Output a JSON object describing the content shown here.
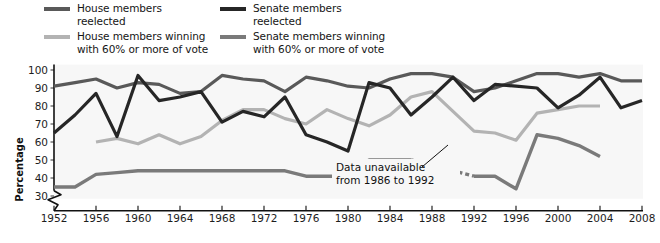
{
  "legend": {
    "columns": [
      [
        {
          "label": "House members reelected",
          "color": "#595959",
          "name": "legend-house-reelected"
        },
        {
          "label": "House members winning\nwith 60% or more of vote",
          "color": "#b3b3b3",
          "name": "legend-house-60"
        }
      ],
      [
        {
          "label": "Senate members reelected",
          "color": "#262626",
          "name": "legend-senate-reelected"
        },
        {
          "label": "Senate members winning\nwith 60% or more of vote",
          "color": "#7a7a7a",
          "name": "legend-senate-60"
        }
      ]
    ]
  },
  "annotation": {
    "line1": "Data unavailable",
    "line2": "from 1986 to 1992"
  },
  "chart_data": {
    "type": "line",
    "title": "",
    "xlabel": "",
    "ylabel": "Percentage",
    "xlim": [
      1950,
      2010
    ],
    "ylim": [
      28,
      103
    ],
    "yticks": [
      30,
      40,
      50,
      60,
      70,
      80,
      90,
      100
    ],
    "xticks": [
      1952,
      1956,
      1960,
      1964,
      1968,
      1972,
      1976,
      1980,
      1984,
      1988,
      1992,
      1996,
      2000,
      2004,
      2008
    ],
    "grid": true,
    "axis_break": true,
    "legend_position": "above-plot",
    "series": [
      {
        "name": "House members reelected",
        "color": "#595959",
        "width": 3.2,
        "x": [
          1952,
          1954,
          1956,
          1958,
          1960,
          1962,
          1964,
          1966,
          1968,
          1970,
          1972,
          1974,
          1976,
          1978,
          1980,
          1982,
          1984,
          1986,
          1988,
          1990,
          1992,
          1994,
          1996,
          1998,
          2000,
          2002,
          2004,
          2006,
          2008
        ],
        "values": [
          91,
          93,
          95,
          90,
          93,
          92,
          87,
          88,
          97,
          95,
          94,
          88,
          96,
          94,
          91,
          90,
          95,
          98,
          98,
          96,
          88,
          90,
          94,
          98,
          98,
          96,
          98,
          94,
          94
        ]
      },
      {
        "name": "House members winning with 60% or more of vote",
        "color": "#b3b3b3",
        "width": 3.2,
        "x": [
          1956,
          1958,
          1960,
          1962,
          1964,
          1966,
          1968,
          1970,
          1972,
          1974,
          1976,
          1978,
          1980,
          1982,
          1984,
          1986,
          1988,
          1990,
          1992,
          1994,
          1996,
          1998,
          2000,
          2002,
          2004
        ],
        "values": [
          60,
          62,
          59,
          64,
          59,
          63,
          72,
          78,
          78,
          73,
          70,
          78,
          73,
          69,
          75,
          85,
          88,
          77,
          66,
          65,
          61,
          76,
          78,
          80,
          80
        ]
      },
      {
        "name": "Senate members reelected",
        "color": "#262626",
        "width": 3.2,
        "x": [
          1952,
          1954,
          1956,
          1958,
          1960,
          1962,
          1964,
          1966,
          1968,
          1970,
          1972,
          1974,
          1976,
          1978,
          1980,
          1982,
          1984,
          1986,
          1988,
          1990,
          1992,
          1994,
          1996,
          1998,
          2000,
          2002,
          2004,
          2006,
          2008
        ],
        "values": [
          65,
          75,
          87,
          63,
          97,
          83,
          85,
          88,
          71,
          77,
          74,
          85,
          64,
          60,
          55,
          93,
          90,
          75,
          85,
          96,
          83,
          92,
          91,
          90,
          79,
          86,
          96,
          79,
          83
        ]
      },
      {
        "name": "Senate members winning with 60% or more of vote",
        "color": "#7a7a7a",
        "width": 3.4,
        "x": [
          1952,
          1954,
          1956,
          1958,
          1960,
          1962,
          1964,
          1966,
          1968,
          1970,
          1972,
          1974,
          1976,
          1978,
          1980,
          1982,
          1984,
          1986,
          1992,
          1994,
          1996,
          1998,
          2000,
          2002,
          2004
        ],
        "values": [
          35,
          35,
          42,
          43,
          44,
          44,
          44,
          44,
          44,
          44,
          44,
          44,
          41,
          41,
          41,
          50,
          50,
          50,
          41,
          41,
          34,
          64,
          62,
          58,
          52
        ],
        "dashed_segment": {
          "from": 1986,
          "to": 1992,
          "note": "Data unavailable from 1986 to 1992"
        }
      }
    ]
  }
}
